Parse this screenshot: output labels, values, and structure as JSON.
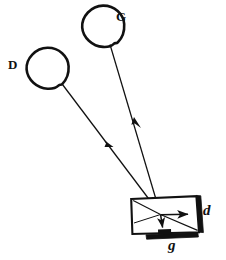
{
  "figure": {
    "type": "optical-ray-diagram",
    "background_color": "#ffffff",
    "ink_color": "#111111",
    "width": 226,
    "height": 260
  },
  "labels": {
    "source_left": "D",
    "source_right": "G",
    "plate_right": "d",
    "plate_bottom": "g"
  },
  "sources": [
    {
      "name": "D",
      "label": "D",
      "shape": "hand-drawn-circle",
      "center_x": 47,
      "center_y": 68,
      "radius_x": 21,
      "radius_y": 20
    },
    {
      "name": "G",
      "label": "G",
      "shape": "hand-drawn-circle",
      "center_x": 103,
      "center_y": 26,
      "radius_x": 21,
      "radius_y": 20
    }
  ],
  "rays": [
    {
      "name": "ray-from-D",
      "from": "D",
      "to": "aperture",
      "x1": 62,
      "y1": 84,
      "x2": 160,
      "y2": 214,
      "arrow_at": 0.52
    },
    {
      "name": "ray-from-G",
      "from": "G",
      "to": "aperture",
      "x1": 110,
      "y1": 44,
      "x2": 160,
      "y2": 214,
      "arrow_at": 0.46
    }
  ],
  "box": {
    "name": "camera-box",
    "corners": [
      {
        "x": 131,
        "y": 199
      },
      {
        "x": 196,
        "y": 196
      },
      {
        "x": 199,
        "y": 232
      },
      {
        "x": 132,
        "y": 234
      }
    ]
  },
  "plates": [
    {
      "name": "plate-d",
      "label": "d",
      "orientation": "vertical",
      "x": 196,
      "y_top": 196,
      "y_bottom": 232,
      "thickness": 4
    },
    {
      "name": "plate-g",
      "label": "g",
      "orientation": "horizontal",
      "x_left": 146,
      "x_right": 196,
      "y": 234,
      "thickness": 4
    }
  ],
  "internal_arrows": [
    {
      "name": "arrow-to-plate-d",
      "direction": "right",
      "x1": 161,
      "y1": 215,
      "x2": 192,
      "y2": 215
    },
    {
      "name": "arrow-to-plate-g",
      "direction": "down",
      "x1": 161,
      "y1": 215,
      "x2": 163,
      "y2": 231
    }
  ],
  "internal_lines": [
    {
      "name": "ray-spread-upper",
      "x1": 160,
      "y1": 214,
      "x2": 133,
      "y2": 201
    },
    {
      "name": "ray-spread-lower",
      "x1": 160,
      "y1": 214,
      "x2": 197,
      "y2": 230
    }
  ]
}
